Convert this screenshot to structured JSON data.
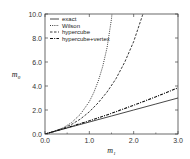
{
  "chart_data": {
    "type": "line",
    "title": "",
    "xlabel": "m",
    "xlabel_sub": "1",
    "ylabel": "m",
    "ylabel_sub": "0",
    "xlim": [
      0.0,
      3.0
    ],
    "ylim": [
      0.0,
      10.0
    ],
    "xticks": [
      0.0,
      1.0,
      2.0,
      3.0
    ],
    "xtick_labels": [
      "0.0",
      "1.0",
      "2.0",
      "3.0"
    ],
    "yticks": [
      0.0,
      2.0,
      4.0,
      6.0,
      8.0,
      10.0
    ],
    "ytick_labels": [
      "0.0",
      "2.0",
      "4.0",
      "6.0",
      "8.0",
      "10.0"
    ],
    "grid": false,
    "legend_position": "top-left",
    "series": [
      {
        "name": "exact",
        "style": "solid",
        "x": [
          0.0,
          0.5,
          1.0,
          1.5,
          2.0,
          2.5,
          3.0
        ],
        "y": [
          0.0,
          0.5,
          1.0,
          1.5,
          2.0,
          2.5,
          3.0
        ]
      },
      {
        "name": "Wilson",
        "style": "dotted",
        "x": [
          0.0,
          0.2,
          0.4,
          0.6,
          0.8,
          1.0,
          1.1,
          1.2,
          1.3,
          1.4,
          1.5,
          1.51
        ],
        "y": [
          0.0,
          0.22,
          0.5,
          0.95,
          1.65,
          2.7,
          3.45,
          4.4,
          5.6,
          7.2,
          9.6,
          10.0
        ]
      },
      {
        "name": "hypercube",
        "style": "dashed",
        "x": [
          0.0,
          0.2,
          0.4,
          0.6,
          0.8,
          1.0,
          1.2,
          1.4,
          1.6,
          1.8,
          2.0,
          2.2,
          2.21
        ],
        "y": [
          0.0,
          0.21,
          0.45,
          0.8,
          1.25,
          1.85,
          2.6,
          3.5,
          4.6,
          6.0,
          7.7,
          9.9,
          10.0
        ]
      },
      {
        "name": "hypercube+vertex",
        "style": "dashdot",
        "x": [
          0.0,
          0.5,
          1.0,
          1.5,
          2.0,
          2.5,
          3.0
        ],
        "y": [
          0.0,
          0.53,
          1.1,
          1.72,
          2.4,
          3.1,
          3.85
        ]
      }
    ]
  },
  "legend": {
    "items": [
      {
        "label": "exact"
      },
      {
        "label": "Wilson"
      },
      {
        "label": "hypercube"
      },
      {
        "label": "hypercube+vertex"
      }
    ]
  }
}
